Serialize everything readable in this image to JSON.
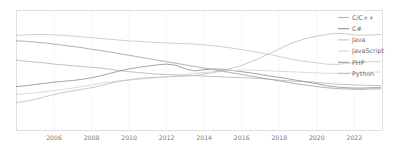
{
  "chart_data": {
    "type": "line",
    "title": "",
    "subtitle": "",
    "xlabel": "",
    "ylabel": "",
    "xlim": [
      2004.0,
      2023.5
    ],
    "ylim": [
      0,
      30
    ],
    "grid": true,
    "grid_axis": "x",
    "legend_position": "right",
    "xticks": [
      "2006",
      "2008",
      "2010",
      "2012",
      "2014",
      "2016",
      "2018",
      "2020",
      "2022"
    ],
    "xtick_values": [
      2006,
      2008,
      2010,
      2012,
      2014,
      2016,
      2018,
      2020,
      2022
    ],
    "yticks": [],
    "x": [
      2004.0,
      2004.5,
      2005.0,
      2005.5,
      2006.0,
      2006.5,
      2007.0,
      2007.5,
      2008.0,
      2008.5,
      2009.0,
      2009.5,
      2010.0,
      2010.5,
      2011.0,
      2011.5,
      2012.0,
      2012.5,
      2013.0,
      2013.5,
      2014.0,
      2014.5,
      2015.0,
      2015.5,
      2016.0,
      2016.5,
      2017.0,
      2017.5,
      2018.0,
      2018.5,
      2019.0,
      2019.5,
      2020.0,
      2020.5,
      2021.0,
      2021.5,
      2022.0,
      2022.5,
      2023.0,
      2023.4
    ],
    "series": [
      {
        "name": "C/C++",
        "color": "#b4b4b4",
        "values": [
          17.6,
          17.3,
          17.1,
          16.9,
          16.6,
          16.4,
          16.2,
          16.0,
          15.8,
          15.6,
          15.3,
          15.0,
          14.7,
          14.5,
          14.3,
          14.1,
          14.0,
          13.9,
          13.8,
          13.7,
          13.6,
          13.5,
          13.4,
          13.3,
          13.2,
          13.1,
          13.0,
          12.8,
          12.6,
          12.4,
          12.3,
          12.2,
          12.0,
          11.8,
          11.6,
          11.5,
          11.4,
          11.3,
          11.3,
          11.2
        ]
      },
      {
        "name": "C#",
        "color": "#8c8c8c",
        "values": [
          11.0,
          11.2,
          11.5,
          11.8,
          12.1,
          12.3,
          12.5,
          12.8,
          13.2,
          13.7,
          14.3,
          14.9,
          15.4,
          15.8,
          16.1,
          16.4,
          16.6,
          16.3,
          15.4,
          14.9,
          15.2,
          15.4,
          15.3,
          15.0,
          14.7,
          14.4,
          14.0,
          13.6,
          13.3,
          12.9,
          12.5,
          12.1,
          11.7,
          11.2,
          10.9,
          10.7,
          10.6,
          10.6,
          10.7,
          10.7
        ]
      },
      {
        "name": "Java",
        "color": "#c4c4c4",
        "values": [
          23.8,
          23.9,
          24.0,
          24.0,
          23.9,
          23.8,
          23.6,
          23.4,
          23.2,
          23.0,
          22.8,
          22.6,
          22.4,
          22.3,
          22.1,
          22.0,
          21.9,
          21.8,
          21.7,
          21.6,
          21.4,
          21.2,
          20.9,
          20.6,
          20.2,
          19.8,
          19.4,
          19.0,
          18.5,
          18.0,
          17.5,
          17.2,
          16.9,
          16.6,
          16.5,
          16.7,
          16.9,
          17.1,
          17.2,
          17.2
        ]
      },
      {
        "name": "JavaScript",
        "color": "#d0d0d0",
        "values": [
          9.0,
          9.2,
          9.4,
          9.7,
          10.0,
          10.3,
          10.6,
          11.0,
          11.4,
          11.8,
          12.1,
          12.4,
          12.6,
          12.8,
          13.0,
          13.2,
          13.4,
          13.7,
          14.0,
          14.3,
          14.5,
          14.7,
          14.9,
          15.0,
          15.1,
          15.1,
          15.0,
          14.9,
          14.8,
          14.7,
          14.6,
          14.5,
          14.4,
          14.3,
          14.3,
          14.3,
          14.4,
          14.5,
          14.6,
          14.6
        ]
      },
      {
        "name": "PHP",
        "color": "#9e9e9e",
        "values": [
          22.4,
          22.3,
          22.1,
          21.9,
          21.6,
          21.3,
          21.0,
          20.7,
          20.3,
          20.0,
          19.6,
          19.2,
          18.8,
          18.4,
          18.0,
          17.6,
          17.2,
          16.8,
          16.4,
          16.0,
          15.6,
          15.2,
          14.8,
          14.4,
          14.0,
          13.6,
          13.2,
          12.8,
          12.4,
          12.0,
          11.6,
          11.3,
          11.0,
          10.7,
          10.5,
          10.4,
          10.3,
          10.3,
          10.4,
          10.4
        ]
      },
      {
        "name": "Python",
        "color": "#bdbdbd",
        "values": [
          7.0,
          7.3,
          7.8,
          8.4,
          9.0,
          9.5,
          9.9,
          10.3,
          10.7,
          11.2,
          11.8,
          12.3,
          12.7,
          13.0,
          13.2,
          13.3,
          13.4,
          13.5,
          13.6,
          13.8,
          14.1,
          14.5,
          15.0,
          15.6,
          16.3,
          17.2,
          18.2,
          19.3,
          20.4,
          21.5,
          22.4,
          23.1,
          23.6,
          24.0,
          24.3,
          24.2,
          23.9,
          23.8,
          23.9,
          24.0
        ]
      }
    ]
  }
}
